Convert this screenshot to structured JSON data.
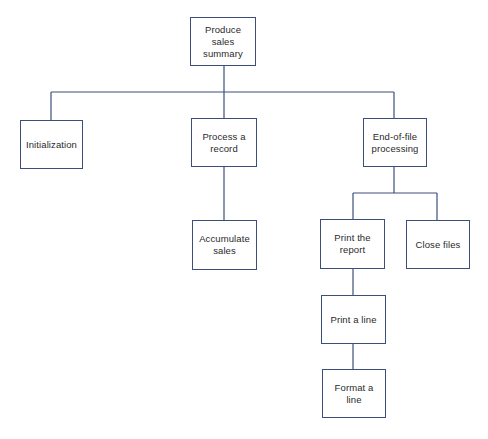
{
  "diagram": {
    "type": "hierarchy-chart",
    "line_color": "#3c4f7a",
    "nodes": {
      "root": {
        "label": "Produce sales summary"
      },
      "init": {
        "label": "Initialization"
      },
      "process": {
        "label": "Process a record"
      },
      "eof": {
        "label": "End-of-file processing"
      },
      "accumulate": {
        "label": "Accumulate sales"
      },
      "print_report": {
        "label": "Print the report"
      },
      "close_files": {
        "label": "Close files"
      },
      "print_line": {
        "label": "Print a line"
      },
      "format_line": {
        "label": "Format a line"
      }
    },
    "edges": [
      {
        "from": "Produce sales summary",
        "to": "Initialization"
      },
      {
        "from": "Produce sales summary",
        "to": "Process a record"
      },
      {
        "from": "Produce sales summary",
        "to": "End-of-file processing"
      },
      {
        "from": "Process a record",
        "to": "Accumulate sales"
      },
      {
        "from": "End-of-file processing",
        "to": "Print the report"
      },
      {
        "from": "End-of-file processing",
        "to": "Close files"
      },
      {
        "from": "Print the report",
        "to": "Print a line"
      },
      {
        "from": "Print a line",
        "to": "Format a line"
      }
    ]
  }
}
